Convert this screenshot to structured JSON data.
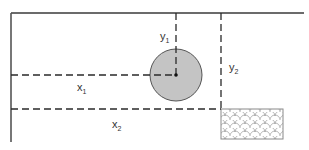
{
  "diagram": {
    "type": "coordinate-position-diagram",
    "labels": {
      "x1": {
        "base": "x",
        "sub": "1"
      },
      "x2": {
        "base": "x",
        "sub": "2"
      },
      "y1": {
        "base": "y",
        "sub": "1"
      },
      "y2": {
        "base": "y",
        "sub": "2"
      }
    },
    "colors": {
      "wall": "#3a3a3a",
      "dash": "#2a2a2a",
      "circle_fill": "#c4c4c4",
      "circle_stroke": "#555555",
      "hatch_stroke": "#9a9a9a",
      "rect_stroke": "#8a8a8a"
    },
    "elements": {
      "top_wall": {
        "x1": 11,
        "y": 13,
        "x2": 304
      },
      "left_wall": {
        "x": 11,
        "y1": 13,
        "y2": 142
      },
      "circle": {
        "cx": 176,
        "cy": 75,
        "r": 26
      },
      "hatched_rect": {
        "x": 221,
        "y": 109,
        "width": 62,
        "height": 30
      },
      "x1_line": {
        "y": 75,
        "from_x": 11,
        "to_x": 176
      },
      "x2_line": {
        "y": 109,
        "from_x": 11,
        "to_x": 221
      },
      "y1_line": {
        "x": 176,
        "from_y": 13,
        "to_y": 75
      },
      "y2_line": {
        "x": 221,
        "from_y": 13,
        "to_y": 109
      }
    }
  }
}
